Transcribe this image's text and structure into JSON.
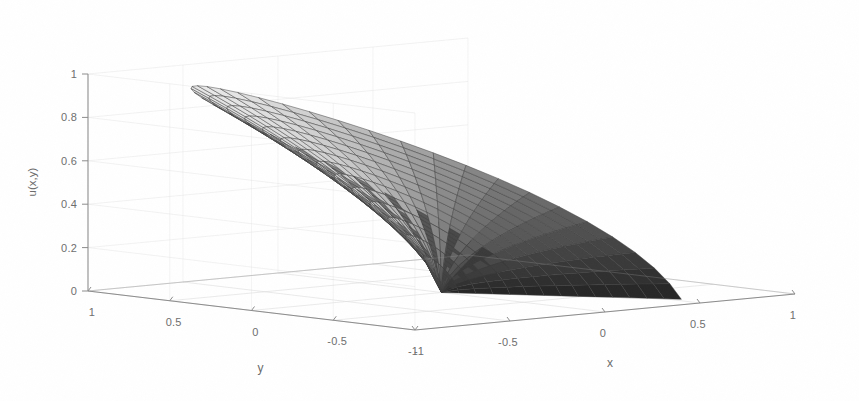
{
  "figure": {
    "kind": "matlab-surface-plot",
    "width": 859,
    "height": 401,
    "background_color": "#ffffff",
    "axis_line_color": "#8c8c8c",
    "grid_color": "#dcdcdc",
    "tick_label_color": "#6e6e6e",
    "mesh_line_color": "#3a3a3a"
  },
  "chart_data": {
    "type": "surface",
    "title": "",
    "subtitle": "",
    "xlabel": "x",
    "ylabel": "y",
    "zlabel": "u(x,y)",
    "grid": true,
    "legend": "none",
    "colormap": "gray",
    "shading": "faceted",
    "projection": "3d-orthographic",
    "view_azimuth_deg": -37.5,
    "view_elevation_deg": 14,
    "xlim": [
      -1,
      1
    ],
    "ylim": [
      -1,
      1
    ],
    "zlim": [
      0,
      1
    ],
    "xticks": [
      -1,
      -0.5,
      0,
      0.5,
      1
    ],
    "xtick_labels": [
      "-1",
      "-0.5",
      "0",
      "0.5",
      "1"
    ],
    "yticks": [
      1,
      0.5,
      0,
      -0.5,
      -1
    ],
    "ytick_labels": [
      "1",
      "0.5",
      "0",
      "-0.5",
      "-1"
    ],
    "zticks": [
      0,
      0.2,
      0.4,
      0.6,
      0.8,
      1
    ],
    "ztick_labels": [
      "0",
      "0.2",
      "0.4",
      "0.6",
      "0.8",
      "1"
    ],
    "domain": {
      "shape": "unit-disk",
      "radius_min": 0,
      "radius_max": 1,
      "theta_min_deg": 0,
      "theta_max_deg": 360
    },
    "mesh": {
      "radial_divisions": 14,
      "angular_divisions": 36,
      "description": "polar mesh: concentric rings plus radial spokes"
    },
    "surface_formula": "u = r^(2/3) * sin(2*theta/3)",
    "z_range_observed": [
      0.0,
      1.0
    ]
  },
  "axes": {
    "x": {
      "label": "x",
      "ticks": [
        {
          "value": -1,
          "label": "-1"
        },
        {
          "value": -0.5,
          "label": "-0.5"
        },
        {
          "value": 0,
          "label": "0"
        },
        {
          "value": 0.5,
          "label": "0.5"
        },
        {
          "value": 1,
          "label": "1"
        }
      ]
    },
    "y": {
      "label": "y",
      "ticks": [
        {
          "value": 1,
          "label": "1"
        },
        {
          "value": 0.5,
          "label": "0.5"
        },
        {
          "value": 0,
          "label": "0"
        },
        {
          "value": -0.5,
          "label": "-0.5"
        },
        {
          "value": -1,
          "label": "-1"
        }
      ]
    },
    "z": {
      "label": "u(x,y)",
      "ticks": [
        {
          "value": 0,
          "label": "0"
        },
        {
          "value": 0.2,
          "label": "0.2"
        },
        {
          "value": 0.4,
          "label": "0.4"
        },
        {
          "value": 0.6,
          "label": "0.6"
        },
        {
          "value": 0.8,
          "label": "0.8"
        },
        {
          "value": 1,
          "label": "1"
        }
      ]
    }
  }
}
